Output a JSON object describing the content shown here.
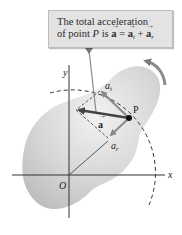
{
  "callout": {
    "line1": "The total acceleration",
    "line2_prefix": "of point ",
    "line2_point": "P",
    "line2_is": " is ",
    "vec_a": "a",
    "equals": " = ",
    "vec_at": "a",
    "sub_t": "t",
    "plus": " + ",
    "vec_ar": "a",
    "sub_r": "r"
  },
  "labels": {
    "y_axis": "y",
    "x_axis": "x",
    "origin": "O",
    "point": "P",
    "a_t": "a",
    "a_t_sub": "t",
    "a_r": "a",
    "a_r_sub": "r",
    "a_total": "a"
  },
  "colors": {
    "body_fill": "#d4d4d4",
    "callout_bg": "#e3e3e3",
    "vector_gray": "#8a8a8a",
    "vector_dark": "#444444",
    "axis": "#333333"
  }
}
